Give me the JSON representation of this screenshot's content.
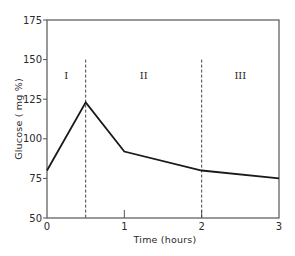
{
  "chart_data": {
    "type": "line",
    "title": "",
    "xlabel": "Time (hours)",
    "ylabel": "Glucose ( mg %)",
    "xlim": [
      0,
      3
    ],
    "ylim": [
      50,
      175
    ],
    "xticks": [
      0,
      1,
      2,
      3
    ],
    "xtick_labels": [
      "0",
      "1",
      "2",
      "3"
    ],
    "yticks": [
      50,
      75,
      100,
      125,
      150,
      175
    ],
    "ytick_labels": [
      "50",
      "75",
      "100",
      "125",
      "150",
      "175"
    ],
    "grid": false,
    "legend": null,
    "series": [
      {
        "name": "Glucose",
        "x": [
          0,
          0.5,
          1,
          2,
          3
        ],
        "y": [
          80,
          123,
          92,
          80,
          75
        ]
      }
    ],
    "annotations": [
      {
        "type": "vline",
        "x": 0.5,
        "y_from": 50,
        "y_to": 150,
        "style": "dashed"
      },
      {
        "type": "vline",
        "x": 2,
        "y_from": 50,
        "y_to": 150,
        "style": "dashed"
      },
      {
        "type": "text",
        "text": "I",
        "x": 0.25,
        "y": 140
      },
      {
        "type": "text",
        "text": "II",
        "x": 1.25,
        "y": 140
      },
      {
        "type": "text",
        "text": "III",
        "x": 2.5,
        "y": 140
      }
    ],
    "colors": {
      "line": "#1a1a1a",
      "axis": "#555555",
      "text": "#2a2a2a"
    }
  }
}
